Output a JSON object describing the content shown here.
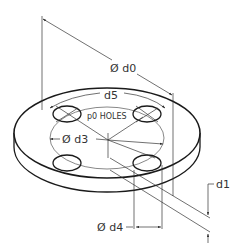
{
  "diagram": {
    "line_color": "#222222",
    "text_color": "#333333",
    "background": "#ffffff",
    "labels": {
      "d0": "Ø d0",
      "d5": "d5",
      "holes": "p0 HOLES",
      "d3": "Ø d3",
      "d4": "Ø d4",
      "d1": "d1"
    }
  }
}
